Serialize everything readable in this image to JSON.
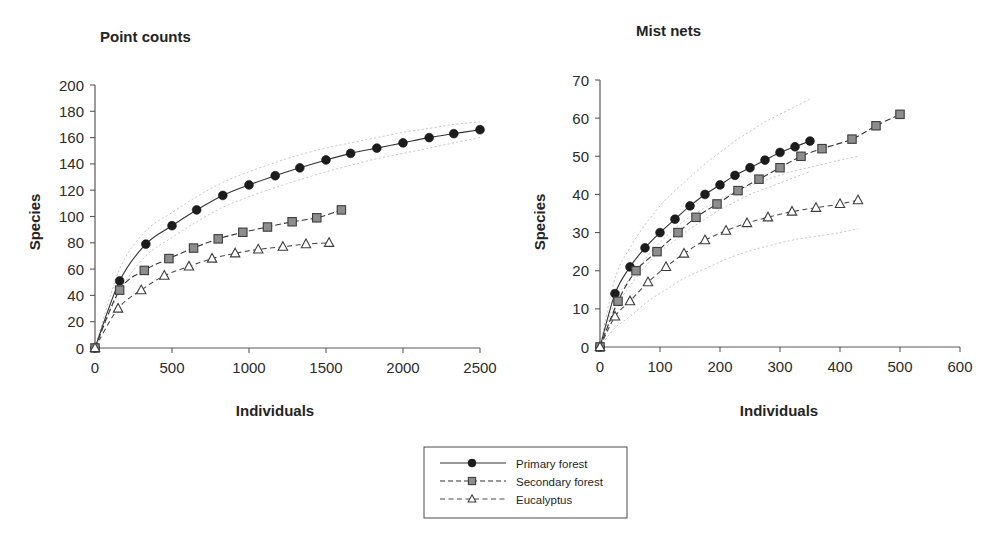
{
  "figure": {
    "background": "#ffffff",
    "width": 995,
    "height": 538
  },
  "legend": {
    "entries": [
      {
        "label": "Primary forest",
        "marker": "filled-circle",
        "line": "solid",
        "color": "#1c1c1c"
      },
      {
        "label": "Secondary forest",
        "marker": "filled-square",
        "line": "faint-solid",
        "color": "#8d8d8d"
      },
      {
        "label": "Eucalyptus",
        "marker": "open-triangle",
        "line": "dashed",
        "color": "#ffffff"
      }
    ],
    "border_color": "#4a4a4a",
    "position": "bottom-center"
  },
  "chart_data": [
    {
      "type": "line",
      "title": "Point counts",
      "xlabel": "Individuals",
      "ylabel": "Species",
      "xlim": [
        0,
        2500
      ],
      "ylim": [
        0,
        200
      ],
      "xticks": [
        0,
        500,
        1000,
        1500,
        2000,
        2500
      ],
      "yticks": [
        0,
        20,
        40,
        60,
        80,
        100,
        120,
        140,
        160,
        180,
        200
      ],
      "grid": false,
      "legend_position": "external-bottom",
      "annotation": "Species accumulation curves with dotted 95% confidence bands for the Primary forest series",
      "series": [
        {
          "name": "Primary forest",
          "marker": "filled-circle",
          "line": "solid",
          "x": [
            0,
            160,
            330,
            500,
            660,
            830,
            1000,
            1170,
            1330,
            1500,
            1660,
            1830,
            2000,
            2170,
            2330,
            2500
          ],
          "y": [
            0,
            51,
            79,
            93,
            105,
            116,
            124,
            131,
            137,
            143,
            148,
            152,
            156,
            160,
            163,
            166
          ],
          "ci_upper": [
            0,
            60,
            89,
            103,
            115,
            126,
            134,
            141,
            147,
            152,
            156,
            160,
            164,
            167,
            170,
            172
          ],
          "ci_lower": [
            0,
            43,
            70,
            84,
            96,
            107,
            115,
            122,
            128,
            134,
            139,
            144,
            148,
            152,
            156,
            160
          ]
        },
        {
          "name": "Secondary forest",
          "marker": "filled-square",
          "line": "faint-solid",
          "x": [
            0,
            160,
            320,
            480,
            640,
            800,
            960,
            1120,
            1280,
            1440,
            1600
          ],
          "y": [
            0,
            44,
            59,
            68,
            76,
            83,
            88,
            92,
            96,
            99,
            105
          ]
        },
        {
          "name": "Eucalyptus",
          "marker": "open-triangle",
          "line": "dashed",
          "x": [
            0,
            150,
            300,
            450,
            610,
            760,
            910,
            1060,
            1220,
            1370,
            1520
          ],
          "y": [
            0,
            30,
            44,
            55,
            62,
            68,
            72,
            75,
            77,
            79,
            80
          ]
        }
      ]
    },
    {
      "type": "line",
      "title": "Mist nets",
      "xlabel": "Individuals",
      "ylabel": "Species",
      "xlim": [
        0,
        600
      ],
      "ylim": [
        0,
        70
      ],
      "xticks": [
        0,
        100,
        200,
        300,
        400,
        500,
        600
      ],
      "yticks": [
        0,
        10,
        20,
        30,
        40,
        50,
        60,
        70
      ],
      "grid": false,
      "legend_position": "external-bottom",
      "annotation": "Species accumulation curves with dotted 95% confidence bands for Primary forest and Eucalyptus series",
      "series": [
        {
          "name": "Primary forest",
          "marker": "filled-circle",
          "line": "solid",
          "x": [
            0,
            25,
            50,
            75,
            100,
            125,
            150,
            175,
            200,
            225,
            250,
            275,
            300,
            325,
            350
          ],
          "y": [
            0,
            14,
            21,
            26,
            30,
            33.5,
            37,
            40,
            42.5,
            45,
            47,
            49,
            51,
            52.5,
            54
          ],
          "ci_upper": [
            0,
            18,
            26,
            32,
            37,
            41,
            44.5,
            48,
            51,
            54,
            56.5,
            59,
            61,
            63,
            65
          ],
          "ci_lower": [
            0,
            10,
            16,
            21,
            25,
            28,
            31,
            33.5,
            36,
            38,
            40,
            41.5,
            43,
            44.5,
            46
          ]
        },
        {
          "name": "Secondary forest",
          "marker": "filled-square",
          "line": "faint-solid",
          "x": [
            0,
            30,
            60,
            95,
            130,
            160,
            195,
            230,
            265,
            300,
            335,
            370,
            420,
            460,
            500
          ],
          "y": [
            0,
            12,
            20,
            25,
            30,
            34,
            37.5,
            41,
            44,
            47,
            50,
            52,
            54.5,
            58,
            61
          ]
        },
        {
          "name": "Eucalyptus",
          "marker": "open-triangle",
          "line": "dashed",
          "x": [
            0,
            25,
            50,
            80,
            110,
            140,
            175,
            210,
            245,
            280,
            320,
            360,
            400,
            430
          ],
          "y": [
            0,
            8,
            12,
            17,
            21,
            24.5,
            28,
            30.5,
            32.5,
            34,
            35.5,
            36.5,
            37.5,
            38.5
          ],
          "ci_upper": [
            0,
            12,
            18,
            24,
            29,
            33,
            36.5,
            39.5,
            42,
            44,
            46,
            47.5,
            49,
            50
          ],
          "ci_lower": [
            0,
            5,
            8,
            12,
            15,
            18,
            20.5,
            23,
            25,
            26.5,
            28,
            29,
            30,
            31
          ]
        }
      ]
    }
  ]
}
